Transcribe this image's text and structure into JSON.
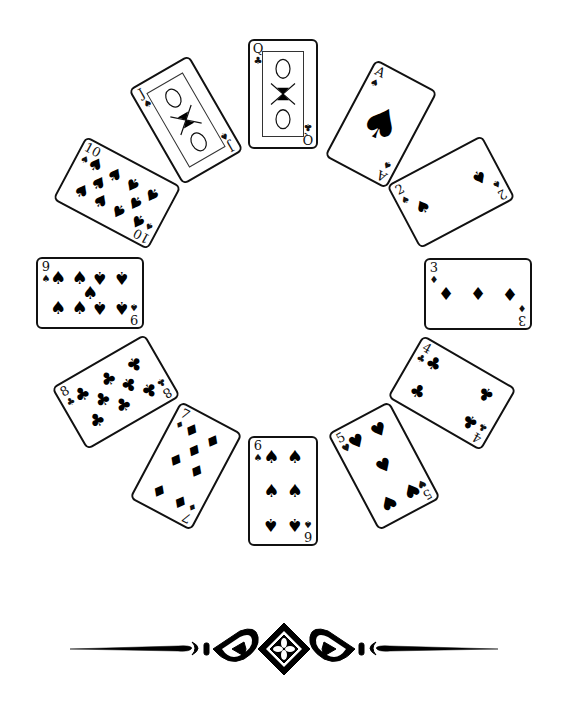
{
  "illustration": {
    "title": "Circle of playing cards",
    "cards": [
      {
        "rank": "Q",
        "suit": "♣",
        "suit_name": "clubs",
        "kind": "face",
        "cx": 283,
        "cy": 94,
        "rot": 0,
        "land": false
      },
      {
        "rank": "A",
        "suit": "♠",
        "suit_name": "spades",
        "kind": "ace",
        "cx": 381,
        "cy": 124,
        "rot": 28,
        "land": false
      },
      {
        "rank": "2",
        "suit": "♠",
        "suit_name": "spades",
        "kind": "pips",
        "cx": 451,
        "cy": 192,
        "rot": -28,
        "land": true
      },
      {
        "rank": "3",
        "suit": "♦",
        "suit_name": "diamonds",
        "kind": "pips",
        "cx": 478,
        "cy": 294,
        "rot": 0,
        "land": true
      },
      {
        "rank": "4",
        "suit": "♣",
        "suit_name": "clubs",
        "kind": "pips",
        "cx": 452,
        "cy": 393,
        "rot": 30,
        "land": true
      },
      {
        "rank": "5",
        "suit": "♥",
        "suit_name": "hearts",
        "kind": "pips",
        "cx": 384,
        "cy": 466,
        "rot": -28,
        "land": false
      },
      {
        "rank": "6",
        "suit": "♠",
        "suit_name": "spades",
        "kind": "pips",
        "cx": 283,
        "cy": 491,
        "rot": 0,
        "land": false
      },
      {
        "rank": "7",
        "suit": "♦",
        "suit_name": "diamonds",
        "kind": "pips",
        "cx": 186,
        "cy": 466,
        "rot": 28,
        "land": false
      },
      {
        "rank": "8",
        "suit": "♣",
        "suit_name": "clubs",
        "kind": "pips",
        "cx": 116,
        "cy": 392,
        "rot": -30,
        "land": true
      },
      {
        "rank": "9",
        "suit": "♠",
        "suit_name": "spades",
        "kind": "pips",
        "cx": 90,
        "cy": 293,
        "rot": 0,
        "land": true
      },
      {
        "rank": "10",
        "suit": "♠",
        "suit_name": "spades",
        "kind": "pips",
        "cx": 117,
        "cy": 193,
        "rot": 28,
        "land": true
      },
      {
        "rank": "J",
        "suit": "♠",
        "suit_name": "spades",
        "kind": "face",
        "cx": 186,
        "cy": 120,
        "rot": -30,
        "land": false
      }
    ],
    "ornament": "decorative-divider"
  }
}
